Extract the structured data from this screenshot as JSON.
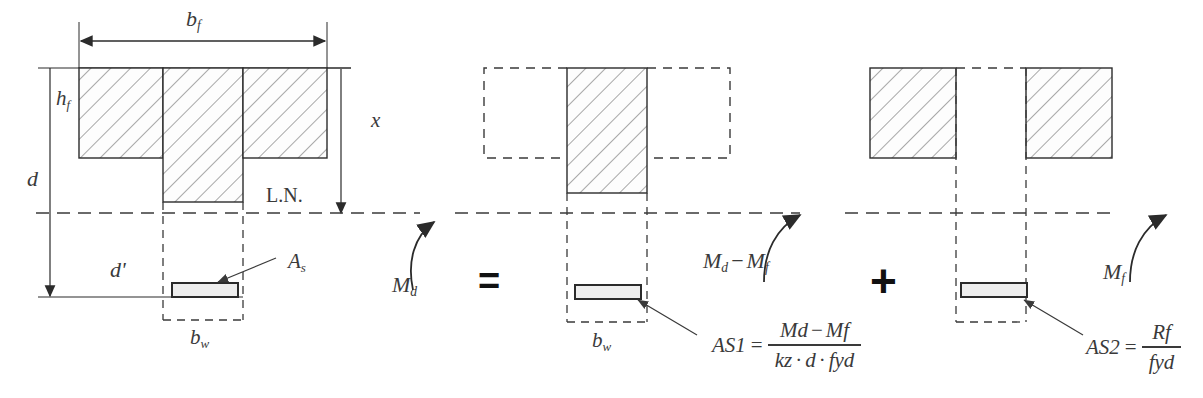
{
  "figure": {
    "type": "engineering-cross-section-diagram",
    "stroke_color": "#2b2b2b",
    "hatch_color": "#6b6b6b",
    "dash_color": "#3a3a3a",
    "text_color": "#3a3a3a",
    "fill_color": "#fdfdfd",
    "rebar_fill": "#eeeeee"
  },
  "left_section": {
    "name": "full T-section with neutral axis",
    "dim_bf": "b",
    "dim_bf_sub": "f",
    "dim_hf": "h",
    "dim_hf_sub": "f",
    "dim_d": "d",
    "dim_dprime": "d'",
    "dim_x": "x",
    "dim_bw": "b",
    "dim_bw_sub": "w",
    "neutral_axis_label": "L.N.",
    "rebar_label": "A",
    "rebar_label_sub": "s",
    "moment_label": "M",
    "moment_label_sub": "d"
  },
  "operators": {
    "equals": "=",
    "plus": "+"
  },
  "middle_section": {
    "name": "web-only rectangular part",
    "dim_bw": "b",
    "dim_bw_sub": "w",
    "moment_label": "M",
    "moment_label_sub_1": "d",
    "moment_minus": "−",
    "moment_label_2": "M",
    "moment_label_sub_2": "f",
    "rebar_formula": {
      "lhs_symbol": "A",
      "lhs_sub": "S1",
      "equals": "=",
      "numerator": [
        {
          "sym": "M",
          "sub": "d"
        },
        {
          "op": "−"
        },
        {
          "sym": "M",
          "sub": "f"
        }
      ],
      "denominator": [
        {
          "sym": "k",
          "sub": "z"
        },
        {
          "op": "·"
        },
        {
          "sym": "d"
        },
        {
          "op": "·"
        },
        {
          "sym": "f",
          "sub": "yd"
        }
      ]
    }
  },
  "right_section": {
    "name": "flange overhangs part",
    "moment_label": "M",
    "moment_label_sub": "f",
    "rebar_formula": {
      "lhs_symbol": "A",
      "lhs_sub": "S2",
      "equals": "=",
      "numerator": [
        {
          "sym": "R",
          "sub": "f"
        }
      ],
      "denominator": [
        {
          "sym": "f",
          "sub": "yd"
        }
      ]
    }
  }
}
